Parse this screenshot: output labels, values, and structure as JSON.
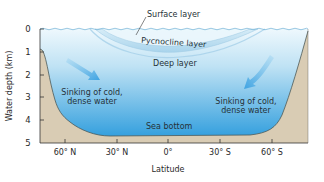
{
  "diagram": {
    "labels": {
      "surface_layer": "Surface layer",
      "pycnocline_layer": "Pycnocline layer",
      "deep_layer": "Deep layer",
      "sinking_left_line1": "Sinking of cold,",
      "sinking_left_line2": "dense water",
      "sinking_right_line1": "Sinking of cold,",
      "sinking_right_line2": "dense water",
      "sea_bottom": "Sea bottom"
    },
    "y_axis": {
      "title": "Water depth (km)",
      "ticks": [
        "0",
        "1",
        "2",
        "3",
        "4",
        "5"
      ]
    },
    "x_axis": {
      "title": "Latitude",
      "ticks": [
        "60° N",
        "30° N",
        "0°",
        "30° S",
        "60° S"
      ]
    },
    "colors": {
      "water_top": "#e6f4fb",
      "water_bottom": "#3fa6e0",
      "seafloor": "#d8cbb3",
      "pycnocline": "#b9dcef",
      "arrow": "#4aa9e3",
      "text": "#2a2a2a"
    }
  }
}
